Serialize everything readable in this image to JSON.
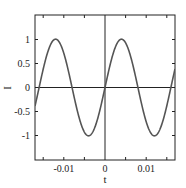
{
  "chart_data": {
    "type": "line",
    "title": "",
    "xlabel": "t",
    "ylabel": "I",
    "xlim": [
      -0.017,
      0.017
    ],
    "ylim": [
      -1.5,
      1.5
    ],
    "grid": false,
    "legend": null,
    "x_ticks": [
      -0.01,
      0,
      0.01
    ],
    "x_tick_labels": [
      "-0.01",
      "0",
      "0.01"
    ],
    "x_minor_ticks": [
      -0.015,
      -0.005,
      0.005,
      0.015
    ],
    "y_ticks": [
      1,
      0.5,
      0,
      -0.5,
      -1
    ],
    "y_tick_labels": [
      "1",
      "0.5",
      "0",
      "-0.5",
      "-1"
    ],
    "reference_lines": {
      "horizontal": 0,
      "vertical": 0
    },
    "series": [
      {
        "name": "I(t) = sin(2πt/T), T ≈ 0.016",
        "color": "#555555",
        "x": [
          -0.016,
          -0.014,
          -0.012,
          -0.01,
          -0.008,
          -0.006,
          -0.004,
          -0.002,
          0.0,
          0.002,
          0.004,
          0.006,
          0.008,
          0.01,
          0.012,
          0.014,
          0.016
        ],
        "values": [
          0.0,
          0.71,
          1.0,
          0.71,
          0.0,
          -0.71,
          -1.0,
          -0.71,
          0.0,
          0.71,
          1.0,
          0.71,
          0.0,
          -0.71,
          -1.0,
          -0.71,
          0.0
        ]
      }
    ]
  },
  "labels": {
    "xlabel": "t",
    "ylabel": "I",
    "xticks": [
      "-0.01",
      "0",
      "0.01"
    ],
    "yticks": [
      "1",
      "0.5",
      "0",
      "-0.5",
      "-1"
    ]
  },
  "colors": {
    "curve": "#555555",
    "axes": "#222222"
  }
}
